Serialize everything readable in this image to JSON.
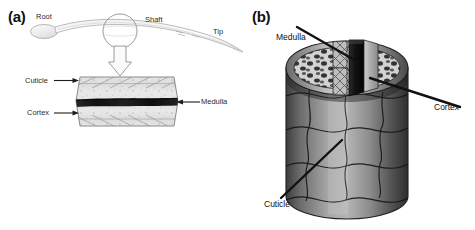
{
  "figure": {
    "caption_visible": false,
    "background_color": "#ffffff",
    "panels": [
      {
        "tag": "(a)",
        "description": "Whole hair fibre with longitudinal section",
        "labels": [
          {
            "text": "Root",
            "points_to": "hair-bulb",
            "arrow": "none"
          },
          {
            "text": "Shaft",
            "points_to": "hair-shaft",
            "arrow": "none"
          },
          {
            "text": "Tip",
            "points_to": "hair-tip",
            "arrow": "none"
          },
          {
            "text": "Cuticle",
            "points_to": "section-outer-layer",
            "arrow": "right"
          },
          {
            "text": "Cortex",
            "points_to": "section-middle-layer",
            "arrow": "right"
          },
          {
            "text": "Medulla",
            "points_to": "section-core-band",
            "arrow": "left"
          }
        ]
      },
      {
        "tag": "(b)",
        "description": "Three-dimensional cut-away cylinder of a hair fibre",
        "labels": [
          {
            "text": "Medulla",
            "points_to": "cylinder-core",
            "arrow": "leader-line"
          },
          {
            "text": "Cortex",
            "points_to": "cylinder-cortex",
            "arrow": "leader-line"
          },
          {
            "text": "Cuticle",
            "points_to": "cylinder-surface",
            "arrow": "leader-line"
          }
        ]
      }
    ]
  },
  "colors": {
    "background": "#ffffff",
    "ink": "#111111",
    "label_text": "#2b2b2b",
    "medulla_dark": "#1b1b1b",
    "cortex_light": "#d9d9d9",
    "cuticle_outline": "#6e6e6e",
    "cylinder_mid": "#8a8a8a",
    "cylinder_dark": "#3a3a3a"
  },
  "panel_a": {
    "tag": "(a)",
    "root_label": "Root",
    "shaft_label": "Shaft",
    "tip_label": "Tip",
    "cuticle_label": "Cuticle",
    "cortex_label": "Cortex",
    "medulla_label": "Medulla"
  },
  "panel_b": {
    "tag": "(b)",
    "medulla_label": "Medulla",
    "cortex_label": "Cortex",
    "cuticle_label": "Cuticle"
  }
}
